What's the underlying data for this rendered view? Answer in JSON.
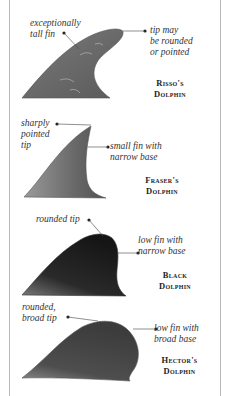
{
  "dolphins": [
    {
      "name_line1": "Risso's",
      "name_line2": "Dolphin",
      "annotations": [
        "exceptionally\ntall fin",
        "tip may\nbe rounded\nor pointed"
      ]
    },
    {
      "name_line1": "Fraser's",
      "name_line2": "Dolphin",
      "annotations": [
        "sharply\npointed\ntip",
        "small fin with\nnarrow base"
      ]
    },
    {
      "name_line1": "Black",
      "name_line2": "Dolphin",
      "annotations": [
        "rounded tip",
        "low fin with\nnarrow base"
      ]
    },
    {
      "name_line1": "Hector's",
      "name_line2": "Dolphin",
      "annotations": [
        "rounded,\nbroad tip",
        "low fin with\nbroad base"
      ]
    }
  ],
  "colors": {
    "risso_fin": "#6b6b6b",
    "fraser_fin": "#6e6e6e",
    "black_fin": "#1f1f1f",
    "hector_fin": "#4a4a4a",
    "frame": "#b8b8b8"
  }
}
